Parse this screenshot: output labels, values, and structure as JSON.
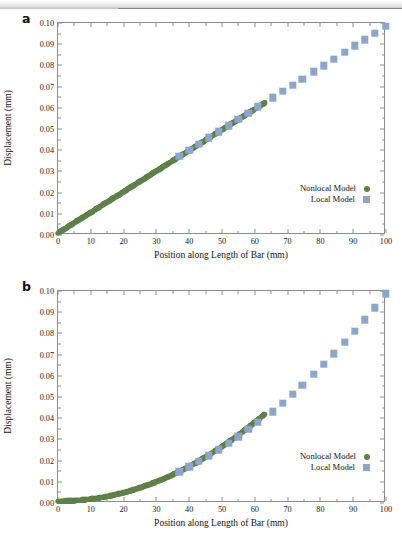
{
  "figure": {
    "panel_a_label": "a",
    "panel_b_label": "b"
  },
  "chart_data": [
    {
      "type": "scatter",
      "panel": "a",
      "title": "",
      "xlabel": "Position along Length of Bar (mm)",
      "ylabel": "Displacement (mm)",
      "xlim": [
        0,
        100
      ],
      "ylim": [
        0,
        0.1
      ],
      "xticks": [
        0,
        10,
        20,
        30,
        40,
        50,
        60,
        70,
        80,
        90,
        100
      ],
      "xticklabels": [
        "0",
        "10",
        "20",
        "30",
        "40",
        "50",
        "60",
        "70",
        "80",
        "90",
        "100"
      ],
      "yticks": [
        0.0,
        0.01,
        0.02,
        0.03,
        0.04,
        0.05,
        0.06,
        0.07,
        0.08,
        0.09,
        0.1
      ],
      "yticklabels": [
        "0.00",
        "0.01",
        "0.02",
        "0.03",
        "0.04",
        "0.05",
        "0.06",
        "0.07",
        "0.08",
        "0.09",
        "0.10"
      ],
      "grid": false,
      "legend_position": "lower-right",
      "series": [
        {
          "name": "Nonlocal Model",
          "marker": "circle",
          "color": "#5f8049",
          "x": [
            0,
            0.8,
            1.6,
            2.4,
            3.2,
            4,
            4.8,
            5.6,
            6.4,
            7.2,
            8,
            8.8,
            9.6,
            10.4,
            11.2,
            12,
            12.8,
            13.6,
            14.4,
            15.2,
            16,
            16.8,
            17.6,
            18.4,
            19.2,
            20,
            20.8,
            21.6,
            22.4,
            23.2,
            24,
            24.8,
            25.6,
            26.4,
            27.2,
            28,
            28.8,
            29.6,
            30.4,
            31.2,
            32,
            32.8,
            33.6,
            34.4,
            35.2,
            36,
            36.8,
            37.6,
            38.4,
            39.2,
            40,
            40.8,
            41.6,
            42.4,
            43.2,
            44,
            44.8,
            45.6,
            46.4,
            47.2,
            48,
            48.8,
            49.6,
            50.4,
            51.2,
            52,
            52.8,
            53.6,
            54.4,
            55.2,
            56,
            56.8,
            57.6,
            58.4,
            59.2,
            60,
            60.8,
            61.6,
            62.4,
            63
          ],
          "y": [
            0.0,
            0.0008,
            0.0016,
            0.0023,
            0.0031,
            0.0039,
            0.0047,
            0.0055,
            0.0062,
            0.007,
            0.0078,
            0.0086,
            0.0094,
            0.0101,
            0.0109,
            0.0117,
            0.0125,
            0.0133,
            0.014,
            0.0148,
            0.0156,
            0.0164,
            0.0172,
            0.0179,
            0.0187,
            0.0195,
            0.0203,
            0.0211,
            0.0218,
            0.0226,
            0.0234,
            0.0242,
            0.025,
            0.0257,
            0.0265,
            0.0273,
            0.0281,
            0.0289,
            0.0296,
            0.0304,
            0.0312,
            0.032,
            0.0328,
            0.0335,
            0.0343,
            0.0351,
            0.0359,
            0.0367,
            0.0374,
            0.0382,
            0.039,
            0.0398,
            0.0406,
            0.0413,
            0.0421,
            0.0429,
            0.0437,
            0.0445,
            0.0452,
            0.046,
            0.0468,
            0.0476,
            0.0484,
            0.0491,
            0.0499,
            0.0507,
            0.0515,
            0.0523,
            0.053,
            0.0538,
            0.0546,
            0.0554,
            0.0562,
            0.0569,
            0.0577,
            0.0585,
            0.0593,
            0.0601,
            0.0608,
            0.0614
          ]
        },
        {
          "name": "Local Model",
          "marker": "square",
          "color": "#8ba5cb",
          "x": [
            37,
            40,
            43,
            46,
            49,
            52,
            55,
            58,
            61,
            65.5,
            68.5,
            71.5,
            74.5,
            78,
            81,
            84,
            87.5,
            90.5,
            93.5,
            96.5,
            100
          ],
          "y": [
            0.0361,
            0.039,
            0.0419,
            0.0449,
            0.0478,
            0.0507,
            0.0536,
            0.0566,
            0.0595,
            0.0639,
            0.0668,
            0.0698,
            0.0727,
            0.0761,
            0.079,
            0.082,
            0.0854,
            0.0883,
            0.0912,
            0.0942,
            0.0976
          ]
        }
      ]
    },
    {
      "type": "scatter",
      "panel": "b",
      "title": "",
      "xlabel": "Position along Length of Bar (mm)",
      "ylabel": "Displacement (mm)",
      "xlim": [
        0,
        100
      ],
      "ylim": [
        0,
        0.1
      ],
      "xticks": [
        0,
        10,
        20,
        30,
        40,
        50,
        60,
        70,
        80,
        90,
        100
      ],
      "xticklabels": [
        "0",
        "10",
        "20",
        "30",
        "40",
        "50",
        "60",
        "70",
        "80",
        "90",
        "100"
      ],
      "yticks": [
        0.0,
        0.01,
        0.02,
        0.03,
        0.04,
        0.05,
        0.06,
        0.07,
        0.08,
        0.09,
        0.1
      ],
      "yticklabels": [
        "0.00",
        "0.01",
        "0.02",
        "0.03",
        "0.04",
        "0.05",
        "0.06",
        "0.07",
        "0.08",
        "0.09",
        "0.10"
      ],
      "grid": false,
      "legend_position": "lower-right",
      "series": [
        {
          "name": "Nonlocal Model",
          "marker": "circle",
          "color": "#5f8049",
          "x": [
            0,
            0.8,
            1.6,
            2.4,
            3.2,
            4,
            4.8,
            5.6,
            6.4,
            7.2,
            8,
            8.8,
            9.6,
            10.4,
            11.2,
            12,
            12.8,
            13.6,
            14.4,
            15.2,
            16,
            16.8,
            17.6,
            18.4,
            19.2,
            20,
            20.8,
            21.6,
            22.4,
            23.2,
            24,
            24.8,
            25.6,
            26.4,
            27.2,
            28,
            28.8,
            29.6,
            30.4,
            31.2,
            32,
            32.8,
            33.6,
            34.4,
            35.2,
            36,
            36.8,
            37.6,
            38.4,
            39.2,
            40,
            40.8,
            41.6,
            42.4,
            43.2,
            44,
            44.8,
            45.6,
            46.4,
            47.2,
            48,
            48.8,
            49.6,
            50.4,
            51.2,
            52,
            52.8,
            53.6,
            54.4,
            55.2,
            56,
            56.8,
            57.6,
            58.4,
            59.2,
            60,
            60.8,
            61.6,
            62.4,
            63
          ],
          "y": [
            0.0,
            0.0,
            0.0,
            0.0001,
            0.0001,
            0.0002,
            0.0002,
            0.0003,
            0.0004,
            0.0005,
            0.0006,
            0.0008,
            0.0009,
            0.0011,
            0.0012,
            0.0014,
            0.0016,
            0.0018,
            0.002,
            0.0023,
            0.0025,
            0.0028,
            0.0031,
            0.0034,
            0.0037,
            0.004,
            0.0043,
            0.0047,
            0.005,
            0.0054,
            0.0058,
            0.0062,
            0.0066,
            0.007,
            0.0075,
            0.0079,
            0.0084,
            0.0089,
            0.0094,
            0.0099,
            0.0104,
            0.0109,
            0.0115,
            0.012,
            0.0126,
            0.0132,
            0.0138,
            0.0144,
            0.0151,
            0.0157,
            0.0164,
            0.017,
            0.0177,
            0.0184,
            0.0191,
            0.0199,
            0.0206,
            0.0214,
            0.0221,
            0.0229,
            0.0237,
            0.0245,
            0.0253,
            0.0262,
            0.027,
            0.0279,
            0.0287,
            0.0296,
            0.0305,
            0.0314,
            0.0324,
            0.0333,
            0.0343,
            0.0352,
            0.0362,
            0.0372,
            0.0382,
            0.0392,
            0.0402,
            0.041
          ]
        },
        {
          "name": "Local Model",
          "marker": "square",
          "color": "#8ba5cb",
          "x": [
            37,
            40,
            43,
            46,
            49,
            52,
            55,
            58,
            61,
            65.5,
            68.5,
            71.5,
            74.5,
            78,
            81,
            84,
            87.5,
            90.5,
            93.5,
            96.5,
            100
          ],
          "y": [
            0.0139,
            0.0162,
            0.0187,
            0.0214,
            0.0242,
            0.0272,
            0.0304,
            0.0338,
            0.0373,
            0.0422,
            0.0462,
            0.0503,
            0.0547,
            0.0598,
            0.0645,
            0.0694,
            0.075,
            0.08,
            0.0855,
            0.0912,
            0.0978
          ]
        }
      ]
    }
  ],
  "legend": {
    "nonlocal_label": "Nonlocal Model",
    "local_label": "Local Model",
    "nonlocal_color": "#5f8049",
    "local_color": "#8ba5cb"
  }
}
